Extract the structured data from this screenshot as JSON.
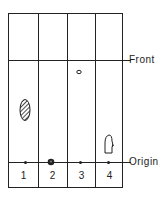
{
  "diagram": {
    "type": "thin-layer chromatography plate",
    "labels": {
      "front": "Front",
      "origin": "Origin"
    },
    "lanes": [
      {
        "label": "1",
        "spot": {
          "shape": "hatched-oval",
          "position": "mid-plate"
        }
      },
      {
        "label": "2",
        "spot": {
          "shape": "filled-dot",
          "position": "at origin"
        }
      },
      {
        "label": "3",
        "spot": {
          "shape": "open-small-oval",
          "position": "just below front"
        }
      },
      {
        "label": "4",
        "spot": {
          "shape": "outlined-irregular",
          "position": "slightly above origin"
        }
      }
    ],
    "colors": {
      "line": "#222222",
      "background": "#ffffff"
    }
  }
}
